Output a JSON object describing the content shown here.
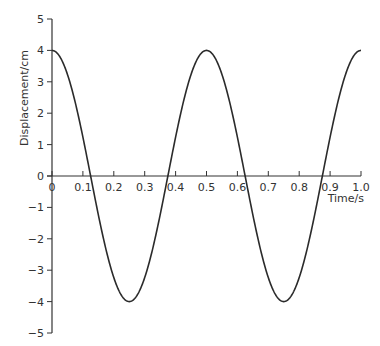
{
  "chart_data": {
    "type": "line",
    "title": "",
    "xlabel": "Time/s",
    "ylabel": "Displacement/cm",
    "xlim": [
      0,
      1.0
    ],
    "ylim": [
      -5,
      5
    ],
    "grid": false,
    "legend": null,
    "x_ticks": [
      "0",
      "0.1",
      "0.2",
      "0.3",
      "0.4",
      "0.5",
      "0.6",
      "0.7",
      "0.8",
      "0.9",
      "1.0"
    ],
    "y_ticks": [
      "−5",
      "−4",
      "−3",
      "−2",
      "−1",
      "0",
      "1",
      "2",
      "3",
      "4",
      "5"
    ],
    "series": [
      {
        "name": "displacement",
        "function": "4*cos(2*pi*t/0.5)",
        "amplitude": 4,
        "period": 0.5,
        "x": [
          0,
          0.125,
          0.25,
          0.375,
          0.5,
          0.625,
          0.75,
          0.875,
          1.0
        ],
        "values": [
          4,
          0,
          -4,
          0,
          4,
          0,
          -4,
          0,
          4
        ]
      }
    ]
  },
  "colors": {
    "line": "#2b2b2b",
    "axis": "#333333",
    "background": "#ffffff"
  }
}
